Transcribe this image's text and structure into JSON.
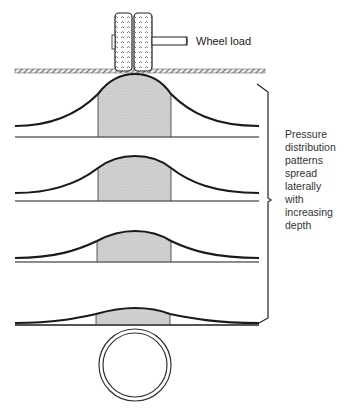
{
  "labels": {
    "wheel_load": "Wheel load",
    "pressure_lines": [
      "Pressure",
      "distribution",
      "patterns",
      "spread",
      "laterally",
      "with",
      "increasing",
      "depth"
    ]
  },
  "colors": {
    "line": "#1a1a1a",
    "shade": "#cfcfcf",
    "baseline": "#666666",
    "ground": "#555555"
  },
  "layers": [
    {
      "name": "depth-1",
      "peak_y": 74,
      "base_y": 137,
      "tail_y": 126
    },
    {
      "name": "depth-2",
      "peak_y": 156,
      "base_y": 201,
      "tail_y": 193
    },
    {
      "name": "depth-3",
      "peak_y": 231,
      "base_y": 262,
      "tail_y": 258
    },
    {
      "name": "depth-4",
      "peak_y": 308,
      "base_y": 325,
      "tail_y": 323
    }
  ],
  "pipe": {
    "cx": 135,
    "cy": 365,
    "r_outer": 36,
    "r_inner": 32
  }
}
